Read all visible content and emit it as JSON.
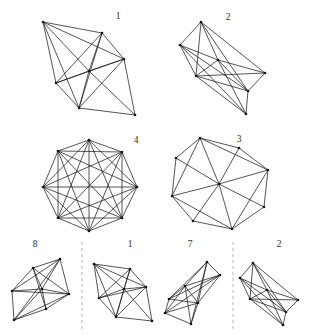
{
  "figure": {
    "background_color": "#ffffff",
    "line_color": "#1c1c1c",
    "vertex_color": "#141414",
    "separator_color": "#d4d2cf",
    "width": 319,
    "height": 335,
    "labels": [
      {
        "name": "label-1-top-left",
        "text": "1",
        "x": 118,
        "y": 17
      },
      {
        "name": "label-2-top-right",
        "text": "2",
        "x": 228,
        "y": 18
      },
      {
        "name": "label-4-mid-left",
        "text": "4",
        "x": 136,
        "y": 141
      },
      {
        "name": "label-3-mid-right",
        "text": "3",
        "x": 239,
        "y": 140
      },
      {
        "name": "label-8-bottom-1",
        "text": "8",
        "x": 35,
        "y": 245
      },
      {
        "name": "label-1-bottom-2",
        "text": "1",
        "x": 130,
        "y": 245
      },
      {
        "name": "label-7-bottom-3",
        "text": "7",
        "x": 190,
        "y": 245
      },
      {
        "name": "label-2-bottom-4",
        "text": "2",
        "x": 279,
        "y": 245
      }
    ],
    "separators": [
      {
        "name": "dashed-separator-left",
        "x": 82,
        "y1": 242,
        "y2": 330
      },
      {
        "name": "dashed-separator-right",
        "x": 233,
        "y1": 242,
        "y2": 330
      }
    ],
    "shapes": [
      {
        "name": "graph-1-top-left",
        "label": "1",
        "vertices": [
          [
            43,
            22
          ],
          [
            102,
            33
          ],
          [
            124,
            59
          ],
          [
            135,
            115
          ],
          [
            79,
            108
          ],
          [
            56,
            83
          ],
          [
            89,
            71
          ]
        ],
        "edges": [
          [
            0,
            1
          ],
          [
            1,
            2
          ],
          [
            2,
            3
          ],
          [
            3,
            4
          ],
          [
            4,
            5
          ],
          [
            5,
            0
          ],
          [
            0,
            2
          ],
          [
            0,
            6
          ],
          [
            1,
            5
          ],
          [
            1,
            6
          ],
          [
            1,
            4
          ],
          [
            2,
            6
          ],
          [
            2,
            5
          ],
          [
            3,
            6
          ],
          [
            4,
            6
          ],
          [
            5,
            6
          ],
          [
            0,
            4
          ],
          [
            2,
            4
          ]
        ]
      },
      {
        "name": "graph-2-top-right",
        "label": "2",
        "vertices": [
          [
            201,
            22
          ],
          [
            180,
            45
          ],
          [
            218,
            60
          ],
          [
            248,
            91
          ],
          [
            265,
            73
          ],
          [
            246,
            114
          ],
          [
            196,
            76
          ]
        ],
        "edges": [
          [
            0,
            1
          ],
          [
            1,
            6
          ],
          [
            6,
            5
          ],
          [
            5,
            3
          ],
          [
            3,
            4
          ],
          [
            4,
            0
          ],
          [
            0,
            2
          ],
          [
            0,
            6
          ],
          [
            1,
            2
          ],
          [
            2,
            4
          ],
          [
            2,
            6
          ],
          [
            2,
            3
          ],
          [
            1,
            3
          ],
          [
            6,
            3
          ],
          [
            2,
            5
          ],
          [
            0,
            3
          ],
          [
            6,
            4
          ],
          [
            1,
            5
          ]
        ]
      },
      {
        "name": "graph-4-mid-left",
        "label": "4",
        "vertices": [
          [
            89,
            140
          ],
          [
            58,
            151
          ],
          [
            43,
            187
          ],
          [
            58,
            218
          ],
          [
            89,
            231
          ],
          [
            122,
            218
          ],
          [
            137,
            187
          ],
          [
            122,
            152
          ]
        ],
        "edges": [
          [
            0,
            1
          ],
          [
            1,
            2
          ],
          [
            2,
            3
          ],
          [
            3,
            4
          ],
          [
            4,
            5
          ],
          [
            5,
            6
          ],
          [
            6,
            7
          ],
          [
            7,
            0
          ],
          [
            0,
            2
          ],
          [
            0,
            3
          ],
          [
            0,
            4
          ],
          [
            0,
            5
          ],
          [
            0,
            6
          ],
          [
            1,
            3
          ],
          [
            1,
            4
          ],
          [
            1,
            5
          ],
          [
            1,
            6
          ],
          [
            1,
            7
          ],
          [
            2,
            4
          ],
          [
            2,
            5
          ],
          [
            2,
            6
          ],
          [
            2,
            7
          ],
          [
            3,
            5
          ],
          [
            3,
            6
          ],
          [
            3,
            7
          ],
          [
            4,
            6
          ],
          [
            4,
            7
          ],
          [
            5,
            7
          ]
        ]
      },
      {
        "name": "graph-3-mid-right",
        "label": "3",
        "vertices": [
          [
            200,
            138
          ],
          [
            176,
            158
          ],
          [
            172,
            196
          ],
          [
            193,
            221
          ],
          [
            232,
            229
          ],
          [
            264,
            207
          ],
          [
            268,
            170
          ],
          [
            239,
            148
          ],
          [
            219,
            184
          ]
        ],
        "edges": [
          [
            0,
            1
          ],
          [
            1,
            2
          ],
          [
            2,
            3
          ],
          [
            3,
            4
          ],
          [
            4,
            5
          ],
          [
            5,
            6
          ],
          [
            6,
            7
          ],
          [
            7,
            0
          ],
          [
            0,
            8
          ],
          [
            1,
            8
          ],
          [
            2,
            8
          ],
          [
            3,
            8
          ],
          [
            4,
            8
          ],
          [
            5,
            8
          ],
          [
            6,
            8
          ],
          [
            7,
            8
          ],
          [
            0,
            2
          ],
          [
            2,
            4
          ],
          [
            4,
            6
          ],
          [
            6,
            0
          ]
        ]
      },
      {
        "name": "graph-8-bottom-1",
        "label": "8",
        "vertices": [
          [
            14,
            320
          ],
          [
            12,
            291
          ],
          [
            33,
            268
          ],
          [
            60,
            259
          ],
          [
            69,
            294
          ],
          [
            46,
            309
          ],
          [
            42,
            289
          ]
        ],
        "edges": [
          [
            0,
            1
          ],
          [
            1,
            2
          ],
          [
            2,
            3
          ],
          [
            3,
            4
          ],
          [
            4,
            5
          ],
          [
            5,
            0
          ],
          [
            0,
            3
          ],
          [
            0,
            4
          ],
          [
            0,
            6
          ],
          [
            1,
            4
          ],
          [
            1,
            6
          ],
          [
            1,
            3
          ],
          [
            2,
            6
          ],
          [
            2,
            4
          ],
          [
            3,
            6
          ],
          [
            4,
            6
          ],
          [
            5,
            6
          ],
          [
            2,
            5
          ]
        ]
      },
      {
        "name": "graph-1-bottom-2",
        "label": "1",
        "vertices": [
          [
            94,
            264
          ],
          [
            130,
            269
          ],
          [
            146,
            287
          ],
          [
            152,
            321
          ],
          [
            116,
            317
          ],
          [
            99,
            298
          ],
          [
            124,
            289
          ]
        ],
        "edges": [
          [
            0,
            1
          ],
          [
            1,
            2
          ],
          [
            2,
            3
          ],
          [
            3,
            4
          ],
          [
            4,
            5
          ],
          [
            5,
            0
          ],
          [
            0,
            2
          ],
          [
            0,
            6
          ],
          [
            1,
            5
          ],
          [
            1,
            6
          ],
          [
            1,
            4
          ],
          [
            2,
            6
          ],
          [
            2,
            5
          ],
          [
            3,
            6
          ],
          [
            4,
            6
          ],
          [
            5,
            6
          ],
          [
            0,
            4
          ],
          [
            2,
            4
          ]
        ]
      },
      {
        "name": "graph-7-bottom-3",
        "label": "7",
        "vertices": [
          [
            207,
            262
          ],
          [
            169,
            299
          ],
          [
            165,
            313
          ],
          [
            191,
            324
          ],
          [
            220,
            275
          ],
          [
            185,
            286
          ],
          [
            198,
            303
          ]
        ],
        "edges": [
          [
            0,
            1
          ],
          [
            1,
            2
          ],
          [
            2,
            3
          ],
          [
            3,
            6
          ],
          [
            6,
            4
          ],
          [
            4,
            0
          ],
          [
            0,
            5
          ],
          [
            1,
            5
          ],
          [
            2,
            5
          ],
          [
            3,
            5
          ],
          [
            5,
            6
          ],
          [
            5,
            4
          ],
          [
            0,
            6
          ],
          [
            1,
            6
          ],
          [
            2,
            6
          ],
          [
            1,
            4
          ],
          [
            2,
            4
          ],
          [
            0,
            3
          ]
        ]
      },
      {
        "name": "graph-2-bottom-4",
        "label": "2",
        "vertices": [
          [
            253,
            263
          ],
          [
            240,
            278
          ],
          [
            267,
            290
          ],
          [
            286,
            312
          ],
          [
            298,
            300
          ],
          [
            283,
            325
          ],
          [
            250,
            299
          ]
        ],
        "edges": [
          [
            0,
            1
          ],
          [
            1,
            6
          ],
          [
            6,
            5
          ],
          [
            5,
            3
          ],
          [
            3,
            4
          ],
          [
            4,
            0
          ],
          [
            0,
            2
          ],
          [
            0,
            6
          ],
          [
            1,
            2
          ],
          [
            2,
            4
          ],
          [
            2,
            6
          ],
          [
            2,
            3
          ],
          [
            1,
            3
          ],
          [
            6,
            3
          ],
          [
            2,
            5
          ],
          [
            0,
            3
          ],
          [
            6,
            4
          ],
          [
            1,
            5
          ]
        ]
      }
    ]
  }
}
